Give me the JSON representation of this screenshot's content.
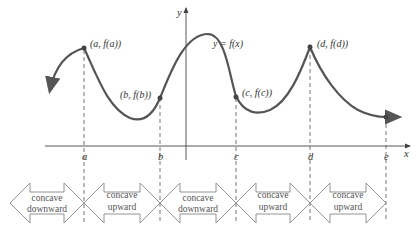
{
  "diagram": {
    "function_label": "y = f(x)",
    "axes": {
      "x_label": "x",
      "y_label": "y"
    },
    "x_ticks": [
      "a",
      "b",
      "c",
      "d",
      "e"
    ],
    "points": [
      {
        "id": "a",
        "label": "(a, f(a))"
      },
      {
        "id": "b",
        "label": "(b, f(b))"
      },
      {
        "id": "c",
        "label": "(c, f(c))"
      },
      {
        "id": "d",
        "label": "(d, f(d))"
      },
      {
        "id": "e",
        "label": ""
      }
    ],
    "intervals": [
      {
        "line1": "concave",
        "line2": "downward"
      },
      {
        "line1": "concave",
        "line2": "upward"
      },
      {
        "line1": "concave",
        "line2": "downward"
      },
      {
        "line1": "concave",
        "line2": "upward"
      },
      {
        "line1": "concave",
        "line2": "upward"
      }
    ],
    "colors": {
      "curve": "#555555",
      "axis": "#444444",
      "dashed": "#666666",
      "arrow_outline": "#888888"
    }
  }
}
